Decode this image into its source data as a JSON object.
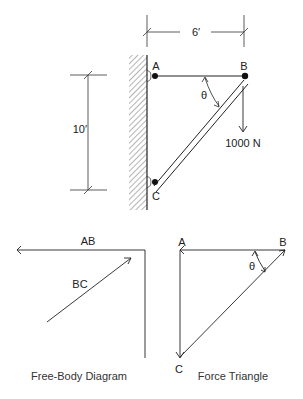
{
  "structure": {
    "dimension_width": "6′",
    "dimension_height": "10′",
    "joint_a": "A",
    "joint_b": "B",
    "joint_c": "C",
    "angle": "θ",
    "load": "1000 N"
  },
  "free_body": {
    "force_ab": "AB",
    "force_bc": "BC",
    "caption": "Free-Body Diagram"
  },
  "force_triangle": {
    "vertex_a": "A",
    "vertex_b": "B",
    "vertex_c": "C",
    "angle": "θ",
    "caption": "Force Triangle"
  }
}
